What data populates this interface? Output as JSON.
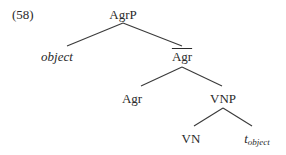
{
  "example": {
    "number": "(58)"
  },
  "tree": {
    "nodes": {
      "root": {
        "label": "AgrP"
      },
      "specifier": {
        "label": "object",
        "style": "italic"
      },
      "agr_bar": {
        "label": "Agr",
        "bar": true
      },
      "agr_head": {
        "label": "Agr"
      },
      "vnp": {
        "label": "VNP"
      },
      "vn": {
        "label": "VN"
      },
      "trace": {
        "base": "t",
        "subscript": "object"
      }
    },
    "edges": [
      [
        "AgrP",
        "object"
      ],
      [
        "AgrP",
        "Agr-bar"
      ],
      [
        "Agr-bar",
        "Agr"
      ],
      [
        "Agr-bar",
        "VNP"
      ],
      [
        "VNP",
        "VN"
      ],
      [
        "VNP",
        "t_object"
      ]
    ]
  }
}
